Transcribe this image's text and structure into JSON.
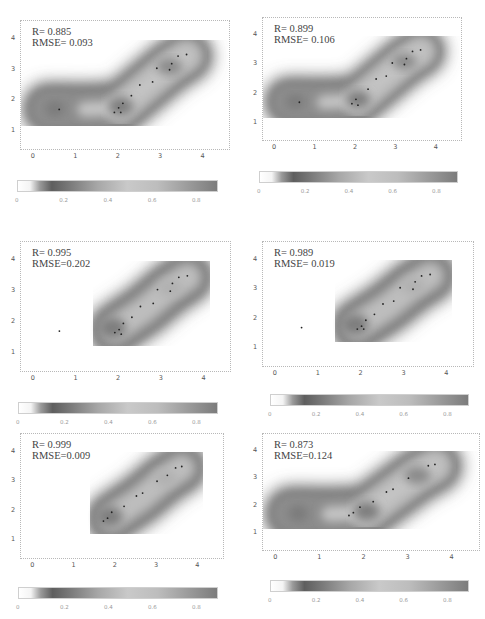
{
  "chart_data": [
    {
      "type": "heatmap",
      "model": "AR",
      "annotation": {
        "r": "R= 0.885",
        "rmse": "RMSE= 0.093"
      },
      "xticks": [
        "0",
        "1",
        "2",
        "3",
        "4"
      ],
      "yticks": [
        "4",
        "3",
        "2",
        "1"
      ],
      "xlim": [
        -0.3,
        4.6
      ],
      "ylim": [
        0.4,
        4.6
      ],
      "colorbar_ticks": [
        "0",
        "0.2",
        "0.4",
        "0.6",
        "0.8"
      ],
      "points": [
        [
          0.6,
          1.7
        ],
        [
          1.9,
          1.6
        ],
        [
          2.0,
          1.75
        ],
        [
          2.05,
          1.6
        ],
        [
          2.1,
          1.9
        ],
        [
          2.3,
          2.15
        ],
        [
          2.5,
          2.5
        ],
        [
          2.8,
          2.6
        ],
        [
          2.9,
          3.05
        ],
        [
          3.2,
          3.0
        ],
        [
          3.25,
          3.2
        ],
        [
          3.4,
          3.45
        ],
        [
          3.6,
          3.5
        ]
      ]
    },
    {
      "type": "heatmap",
      "model": "ARX",
      "annotation": {
        "r": "R= 0.899",
        "rmse": "RMSE= 0.106"
      },
      "xticks": [
        "0",
        "1",
        "2",
        "3",
        "4"
      ],
      "yticks": [
        "4",
        "3",
        "2",
        "1"
      ],
      "xlim": [
        -0.3,
        4.6
      ],
      "ylim": [
        0.4,
        4.6
      ],
      "colorbar_ticks": [
        "0",
        "0.2",
        "0.4",
        "0.6",
        "0.8"
      ],
      "points": [
        [
          0.6,
          1.7
        ],
        [
          1.9,
          1.65
        ],
        [
          2.0,
          1.8
        ],
        [
          2.05,
          1.6
        ],
        [
          2.3,
          2.15
        ],
        [
          2.5,
          2.5
        ],
        [
          2.75,
          2.6
        ],
        [
          2.9,
          3.05
        ],
        [
          3.2,
          3.0
        ],
        [
          3.25,
          3.2
        ],
        [
          3.4,
          3.45
        ],
        [
          3.6,
          3.5
        ]
      ]
    },
    {
      "type": "heatmap",
      "model": "GPR",
      "annotation": {
        "r": "R= 0.995",
        "rmse": "RMSE=0.202"
      },
      "xticks": [
        "0",
        "1",
        "2",
        "3",
        "4"
      ],
      "yticks": [
        "4",
        "3",
        "2",
        "1"
      ],
      "xlim": [
        -0.3,
        4.6
      ],
      "ylim": [
        0.4,
        4.6
      ],
      "colorbar_ticks": [
        "0",
        "0.2",
        "0.4",
        "0.6",
        "0.8"
      ],
      "points": [
        [
          0.6,
          1.7
        ],
        [
          1.9,
          1.65
        ],
        [
          2.0,
          1.75
        ],
        [
          2.05,
          1.6
        ],
        [
          2.1,
          1.95
        ],
        [
          2.3,
          2.15
        ],
        [
          2.5,
          2.5
        ],
        [
          2.8,
          2.6
        ],
        [
          2.9,
          3.05
        ],
        [
          3.2,
          3.0
        ],
        [
          3.25,
          3.25
        ],
        [
          3.4,
          3.45
        ],
        [
          3.6,
          3.5
        ]
      ]
    },
    {
      "type": "heatmap",
      "model": "GP-AR",
      "annotation": {
        "r": "R= 0.989",
        "rmse": "RMSE= 0.019"
      },
      "xticks": [
        "0",
        "1",
        "2",
        "3",
        "4"
      ],
      "yticks": [
        "4",
        "3",
        "2",
        "1"
      ],
      "xlim": [
        -0.3,
        4.6
      ],
      "ylim": [
        0.4,
        4.6
      ],
      "colorbar_ticks": [
        "0",
        "0.2",
        "0.4",
        "0.6",
        "0.8"
      ],
      "points": [
        [
          0.6,
          1.7
        ],
        [
          1.9,
          1.65
        ],
        [
          2.0,
          1.75
        ],
        [
          2.05,
          1.65
        ],
        [
          2.1,
          1.95
        ],
        [
          2.3,
          2.15
        ],
        [
          2.5,
          2.5
        ],
        [
          2.75,
          2.6
        ],
        [
          2.9,
          3.05
        ],
        [
          3.2,
          3.0
        ],
        [
          3.25,
          3.25
        ],
        [
          3.4,
          3.45
        ],
        [
          3.6,
          3.5
        ]
      ]
    },
    {
      "type": "heatmap",
      "model": "GP-ARX",
      "annotation": {
        "r": "R= 0.999",
        "rmse": "RMSE=0.009"
      },
      "xticks": [
        "0",
        "1",
        "2",
        "3",
        "4"
      ],
      "yticks": [
        "4",
        "3",
        "2",
        "1"
      ],
      "xlim": [
        -0.3,
        4.6
      ],
      "ylim": [
        0.4,
        4.6
      ],
      "colorbar_ticks": [
        "0",
        "0.2",
        "0.4",
        "0.6",
        "0.8"
      ],
      "points": [
        [
          1.7,
          1.65
        ],
        [
          1.8,
          1.75
        ],
        [
          1.9,
          1.95
        ],
        [
          2.2,
          2.15
        ],
        [
          2.5,
          2.5
        ],
        [
          2.65,
          2.6
        ],
        [
          3.0,
          3.0
        ],
        [
          3.25,
          3.2
        ],
        [
          3.45,
          3.45
        ],
        [
          3.6,
          3.5
        ]
      ]
    },
    {
      "type": "heatmap",
      "model": "SVM",
      "annotation": {
        "r": "R= 0.873",
        "rmse": "RMSE=0.124"
      },
      "xticks": [
        "0",
        "1",
        "2",
        "3",
        "4"
      ],
      "yticks": [
        "4",
        "3",
        "2",
        "1"
      ],
      "xlim": [
        -0.3,
        4.6
      ],
      "ylim": [
        0.4,
        4.6
      ],
      "colorbar_ticks": [
        "0",
        "0.2",
        "0.4",
        "0.6",
        "0.8"
      ],
      "points": [
        [
          1.65,
          1.65
        ],
        [
          1.75,
          1.75
        ],
        [
          1.9,
          1.95
        ],
        [
          2.2,
          2.15
        ],
        [
          2.5,
          2.5
        ],
        [
          2.65,
          2.6
        ],
        [
          3.0,
          3.0
        ],
        [
          3.45,
          3.45
        ],
        [
          3.6,
          3.5
        ]
      ]
    }
  ]
}
